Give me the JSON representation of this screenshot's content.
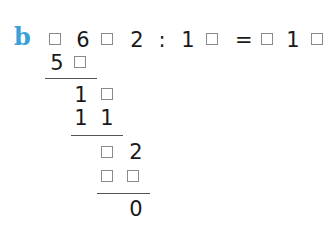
{
  "exercise": {
    "label": "b",
    "label_color": "#3aa0d8",
    "equation": [
      {
        "type": "box"
      },
      {
        "type": "digit",
        "value": "6"
      },
      {
        "type": "box"
      },
      {
        "type": "digit",
        "value": "2"
      },
      {
        "type": "operator",
        "value": ":"
      },
      {
        "type": "digit",
        "value": "1"
      },
      {
        "type": "box"
      },
      {
        "type": "operator",
        "value": "="
      },
      {
        "type": "box"
      },
      {
        "type": "digit",
        "value": "1"
      },
      {
        "type": "box"
      }
    ],
    "working": {
      "row1": [
        "5",
        "box"
      ],
      "row2": [
        "1",
        "box"
      ],
      "row3": [
        "1",
        "1"
      ],
      "row4": [
        "box",
        "2"
      ],
      "row5": [
        "box",
        "box"
      ],
      "row6": [
        "0"
      ]
    },
    "text": {
      "d6": "6",
      "d2": "2",
      "colon": ":",
      "d1a": "1",
      "eq": "=",
      "d1b": "1",
      "w5": "5",
      "w1a": "1",
      "w1b": "1",
      "w1c": "1",
      "w2": "2",
      "w0": "0"
    }
  }
}
